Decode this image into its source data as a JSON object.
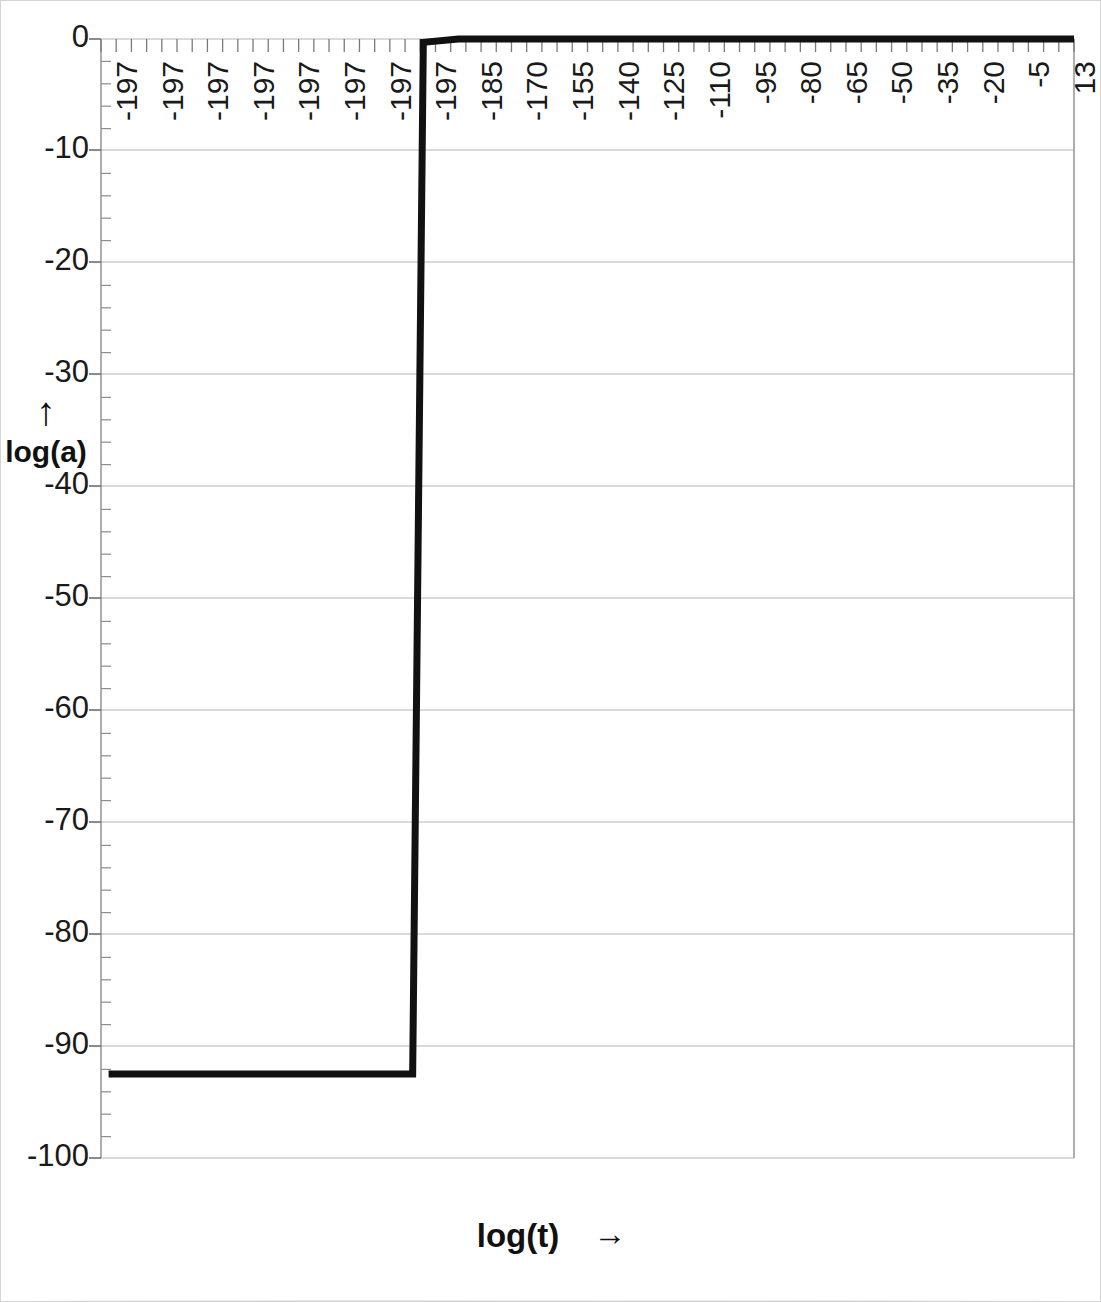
{
  "figure": {
    "background_color": "#ffffff",
    "border_color": "#d4d4d4",
    "series_color": "#111111",
    "gridline_color": "#b8b8b8",
    "axis_color": "#808080"
  },
  "axes": {
    "y_title": "log(a)",
    "y_arrow": "↑",
    "x_title": "log(t)",
    "x_arrow": "→"
  },
  "chart_data": {
    "type": "line",
    "title": "",
    "subtitle": "",
    "xlabel": "log(t)",
    "ylabel": "log(a)",
    "grid": true,
    "legend": null,
    "ylim": [
      -100,
      0
    ],
    "y_ticks": [
      0,
      -10,
      -20,
      -30,
      -40,
      -50,
      -60,
      -70,
      -80,
      -90,
      -100
    ],
    "y_tick_labels": [
      "0",
      "-10",
      "-20",
      "-30",
      "-40",
      "-50",
      "-60",
      "-70",
      "-80",
      "-90",
      "-100"
    ],
    "y_minor_ticks_per_interval": 5,
    "x_tick_labels": [
      "-197",
      "-197",
      "-197",
      "-197",
      "-197",
      "-197",
      "-197",
      "-197",
      "-185",
      "-170",
      "-155",
      "-140",
      "-125",
      "-110",
      "-95",
      "-80",
      "-65",
      "-50",
      "-35",
      "-20",
      "-5",
      "13"
    ],
    "x_minor_tick_count": 64,
    "annotation": "Step-function curve: log(a) stays flat at about -92.5 for early log(t), then rises almost vertically near log(t) = -197 and saturates at log(a) = 0 for the remainder of the range.",
    "series": [
      {
        "name": "log(a) vs log(t)",
        "color": "#111111",
        "line_width_px": 7,
        "points": [
          {
            "x_index": 0.5,
            "y": -92.5
          },
          {
            "x_index": 20.5,
            "y": -92.5
          },
          {
            "x_index": 21.2,
            "y": -0.3
          },
          {
            "x_index": 23.5,
            "y": 0.0
          },
          {
            "x_index": 64.0,
            "y": 0.0
          }
        ]
      }
    ]
  }
}
